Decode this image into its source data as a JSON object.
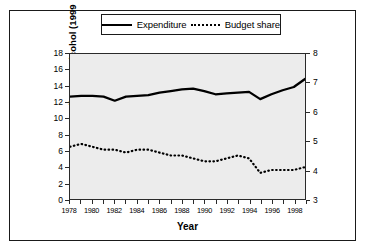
{
  "chart_data": {
    "type": "line",
    "title": "",
    "xlabel": "Year",
    "ylabel": "Expenditure on alcohol (1999 prices)",
    "ylabel_right": "Alcohol budget share (%)",
    "x": [
      1978,
      1979,
      1980,
      1981,
      1982,
      1983,
      1984,
      1985,
      1986,
      1987,
      1988,
      1989,
      1990,
      1991,
      1992,
      1993,
      1994,
      1995,
      1996,
      1997,
      1998,
      1999
    ],
    "xlim": [
      1978,
      1999
    ],
    "xticks_labeled": [
      "1978",
      "1980",
      "1982",
      "1984",
      "1986",
      "1988",
      "1990",
      "1992",
      "1994",
      "1996",
      "1998"
    ],
    "xtick_step": 1,
    "ylim": [
      0,
      18
    ],
    "yticks": [
      "0",
      "2",
      "4",
      "6",
      "8",
      "10",
      "12",
      "14",
      "16",
      "18"
    ],
    "ylim_right": [
      3,
      8
    ],
    "yticks_right": [
      "3",
      "4",
      "5",
      "6",
      "7",
      "8"
    ],
    "grid": false,
    "legend_position": "top",
    "series": [
      {
        "name": "Expenditure",
        "axis": "left",
        "style": "solid",
        "values": [
          12.7,
          12.8,
          12.8,
          12.7,
          12.2,
          12.7,
          12.8,
          12.9,
          13.2,
          13.4,
          13.6,
          13.7,
          13.4,
          13.0,
          13.1,
          13.2,
          13.3,
          12.4,
          13.0,
          13.5,
          13.9,
          14.9
        ]
      },
      {
        "name": "Budget share",
        "axis": "right",
        "style": "dotted",
        "values": [
          4.8,
          4.9,
          4.8,
          4.7,
          4.7,
          4.6,
          4.7,
          4.7,
          4.6,
          4.5,
          4.5,
          4.4,
          4.3,
          4.3,
          4.4,
          4.5,
          4.4,
          3.9,
          4.0,
          4.0,
          4.0,
          4.1
        ]
      }
    ]
  },
  "legend": {
    "expenditure_label": "Expenditure",
    "budget_share_label": "Budget share"
  }
}
